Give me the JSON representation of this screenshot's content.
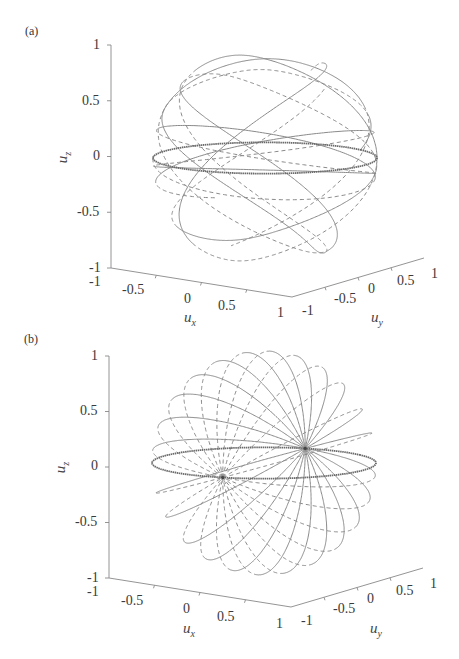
{
  "chart_data": [
    {
      "panel": "(a)",
      "type": "line",
      "subtype": "3d-trajectory-on-unit-sphere",
      "title": "",
      "xlabel": "u_x",
      "ylabel": "u_y",
      "zlabel": "u_z",
      "xlim": [
        -1,
        1
      ],
      "ylim": [
        -1,
        1
      ],
      "zlim": [
        -1,
        1
      ],
      "x_ticks": [
        "-1",
        "-0.5",
        "0",
        "0.5",
        "1"
      ],
      "y_ticks": [
        "-1",
        "-0.5",
        "0",
        "0.5",
        "1"
      ],
      "z_ticks": [
        "-1",
        "-0.5",
        "0",
        "0.5",
        "1"
      ],
      "grid": false,
      "legend": null,
      "series": [
        {
          "name": "trajectory (solid)",
          "style": "solid",
          "description": "precessing orbit looping between latitudes ~ ±0.75 with folds near poles"
        },
        {
          "name": "trajectory (dashed)",
          "style": "dashed",
          "description": "companion orbit, hidden/back portion"
        },
        {
          "name": "equator ring",
          "style": "thick",
          "z": 0
        }
      ]
    },
    {
      "panel": "(b)",
      "type": "line",
      "subtype": "3d-trajectory-on-unit-sphere",
      "title": "",
      "xlabel": "u_x",
      "ylabel": "u_y",
      "zlabel": "u_z",
      "xlim": [
        -1,
        1
      ],
      "ylim": [
        -1,
        1
      ],
      "zlim": [
        -1,
        1
      ],
      "x_ticks": [
        "-1",
        "-0.5",
        "0",
        "0.5",
        "1"
      ],
      "y_ticks": [
        "-1",
        "-0.5",
        "0",
        "0.5",
        "1"
      ],
      "z_ticks": [
        "-1",
        "-0.5",
        "0",
        "0.5",
        "1"
      ],
      "grid": false,
      "legend": null,
      "series": [
        {
          "name": "great-circle orbits (solid)",
          "style": "solid",
          "description": "orbits through two antipodal nodes on equator"
        },
        {
          "name": "great-circle orbits (dashed)",
          "style": "dashed",
          "description": "back-side orbits"
        },
        {
          "name": "equator ring",
          "style": "thick",
          "z": 0
        }
      ],
      "nodes": [
        [
          -0.8,
          0.6,
          0.0
        ],
        [
          0.8,
          -0.6,
          0.0
        ]
      ]
    }
  ],
  "panels": [
    {
      "tag": "(a)",
      "z_axis_label": "u",
      "z_axis_sub": "z",
      "x_axis_label": "u",
      "x_axis_sub": "x",
      "y_axis_label": "u",
      "y_axis_sub": "y",
      "z_ticks": [
        "1",
        "0.5",
        "0",
        "-0.5",
        "-1"
      ],
      "x_ticks": [
        "-1",
        "-0.5",
        "0",
        "0.5",
        "1"
      ],
      "y_ticks": [
        "-1",
        "-0.5",
        "0",
        "0.5",
        "1"
      ]
    },
    {
      "tag": "(b)",
      "z_axis_label": "u",
      "z_axis_sub": "z",
      "x_axis_label": "u",
      "x_axis_sub": "x",
      "y_axis_label": "u",
      "y_axis_sub": "y",
      "z_ticks": [
        "1",
        "0.5",
        "0",
        "-0.5",
        "-1"
      ],
      "x_ticks": [
        "-1",
        "-0.5",
        "0",
        "0.5",
        "1"
      ],
      "y_ticks": [
        "-1",
        "-0.5",
        "0",
        "0.5",
        "1"
      ]
    }
  ],
  "style": {
    "line_color": "#8a8a8a",
    "equator_color": "#6a6a6a",
    "axis_color": "#888888"
  }
}
